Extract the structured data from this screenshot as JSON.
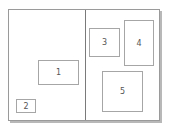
{
  "diagram": {
    "panels": [
      {
        "name": "left-panel"
      },
      {
        "name": "right-panel"
      }
    ],
    "boxes": [
      {
        "label": "1",
        "x": 29,
        "y": 50,
        "w": 41,
        "h": 25
      },
      {
        "label": "2",
        "x": 7,
        "y": 89,
        "w": 20,
        "h": 14
      },
      {
        "label": "3",
        "x": 80,
        "y": 18,
        "w": 31,
        "h": 29
      },
      {
        "label": "4",
        "x": 115,
        "y": 10,
        "w": 30,
        "h": 46
      },
      {
        "label": "5",
        "x": 93,
        "y": 61,
        "w": 41,
        "h": 41
      }
    ]
  }
}
